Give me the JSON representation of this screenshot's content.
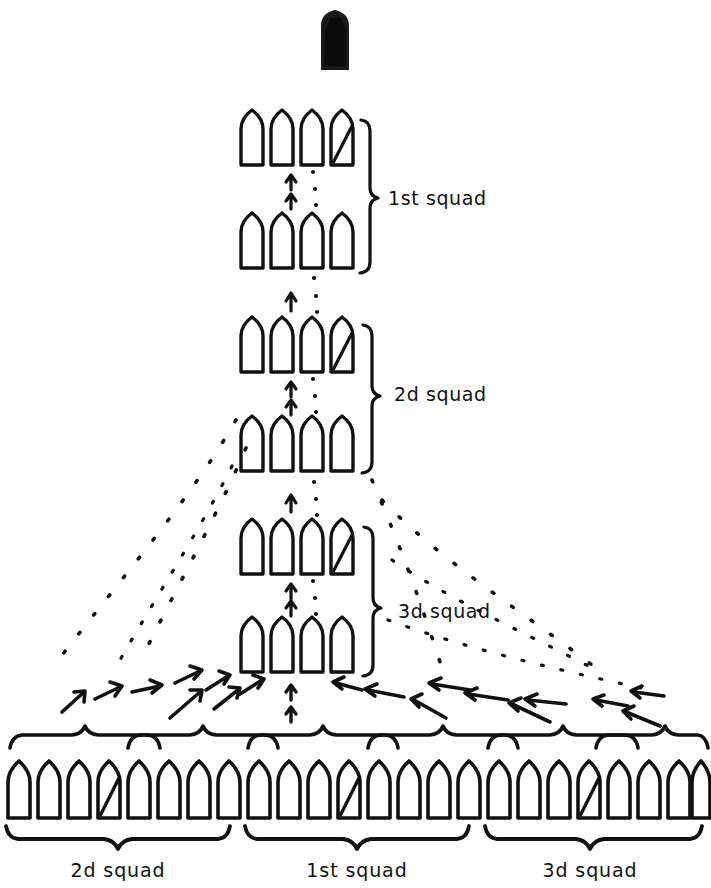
{
  "diagram": {
    "ink_color": "#111111",
    "paper_color": "#ffffff",
    "leader_fill": "#1a1a1a",
    "column": {
      "description": "Column of squads: six ranks of four soldiers each, stacked vertically in the centre, with movement arrows pointing up between ranks.",
      "rank_size": 4,
      "rank_count": 6,
      "ranks": [
        {
          "index": 0,
          "cy": 140,
          "leader_index": 3
        },
        {
          "index": 1,
          "cy": 243,
          "leader_index": -1
        },
        {
          "index": 2,
          "cy": 348,
          "leader_index": 3
        },
        {
          "index": 3,
          "cy": 447,
          "leader_index": -1
        },
        {
          "index": 4,
          "cy": 550,
          "leader_index": 3
        },
        {
          "index": 5,
          "cy": 648,
          "leader_index": -1
        }
      ],
      "x_positions": [
        254,
        284,
        314,
        344
      ],
      "squad_labels": [
        {
          "text": "1st squad",
          "x": 388,
          "y": 198
        },
        {
          "text": "2d squad",
          "x": 394,
          "y": 394
        },
        {
          "text": "3d squad",
          "x": 398,
          "y": 612
        }
      ]
    },
    "line": {
      "description": "Line of squads: twenty-four soldiers in a single rank at the bottom, grouped into three squads of eight, each squad split into two half-squad groups of four.",
      "soldier_count": 24,
      "squad_count": 3,
      "group_size": 4,
      "soldier_y_top": 757,
      "soldier_y_bottom": 818,
      "leader_positions": [
        3,
        11,
        19
      ],
      "squad_labels": [
        {
          "text": "2d squad",
          "x": 118,
          "y": 871
        },
        {
          "text": "1st squad",
          "x": 357,
          "y": 871
        },
        {
          "text": "3d squad",
          "x": 590,
          "y": 871
        }
      ]
    },
    "top_leader": {
      "name": "platoon-leader",
      "x": 322,
      "y": 12,
      "width": 26,
      "height": 57
    }
  }
}
